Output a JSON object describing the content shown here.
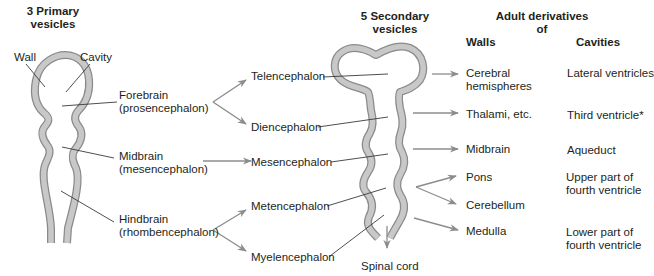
{
  "headers": {
    "primary_line1": "3 Primary",
    "primary_line2": "vesicles",
    "secondary_line1": "5 Secondary",
    "secondary_line2": "vesicles",
    "adult_line1": "Adult derivatives",
    "adult_line2": "of",
    "walls": "Walls",
    "cavities": "Cavities"
  },
  "primary_labels": {
    "wall": "Wall",
    "cavity": "Cavity",
    "forebrain": "Forebrain",
    "forebrain_latin": "(prosencephalon)",
    "midbrain": "Midbrain",
    "midbrain_latin": "(mesencephalon)",
    "hindbrain": "Hindbrain",
    "hindbrain_latin": "(rhombencephalon)"
  },
  "secondary_labels": {
    "telencephalon": "Telencephalon",
    "diencephalon": "Diencephalon",
    "mesencephalon": "Mesencephalon",
    "metencephalon": "Metencephalon",
    "myelencephalon": "Myelencephalon",
    "spinal_cord": "Spinal cord"
  },
  "walls": {
    "cerebral_1": "Cerebral",
    "cerebral_2": "hemispheres",
    "thalami": "Thalami, etc.",
    "midbrain": "Midbrain",
    "pons": "Pons",
    "cerebellum": "Cerebellum",
    "medulla": "Medulla"
  },
  "cavities": {
    "lateral": "Lateral ventricles",
    "third": "Third ventricle*",
    "aqueduct": "Aqueduct",
    "upper_1": "Upper part of",
    "upper_2": "fourth ventricle",
    "lower_1": "Lower part of",
    "lower_2": "fourth ventricle"
  },
  "colors": {
    "tube_fill": "#c8c8c8",
    "tube_stroke": "#8a8a8a",
    "arrow": "#8c8c8c",
    "leader": "#3a3a3a",
    "text": "#231f20"
  }
}
